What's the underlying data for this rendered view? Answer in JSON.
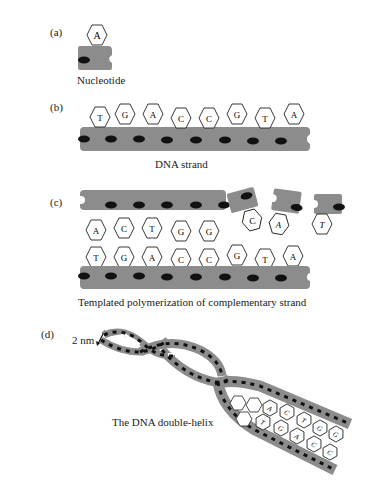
{
  "panels": {
    "a": {
      "label": "(a)",
      "caption": "Nucleotide",
      "base": "A"
    },
    "b": {
      "label": "(b)",
      "caption": "DNA strand",
      "bases": [
        "T",
        "G",
        "A",
        "C",
        "C",
        "G",
        "T",
        "A"
      ]
    },
    "c": {
      "label": "(c)",
      "caption": "Templated polymerization of complementary strand",
      "top_bases_attached": [
        "A",
        "C",
        "T",
        "G",
        "G"
      ],
      "top_bases_free": [
        "C",
        "A",
        "T"
      ],
      "bottom_bases": [
        "T",
        "G",
        "A",
        "C",
        "C",
        "G",
        "T",
        "A"
      ]
    },
    "d": {
      "label": "(d)",
      "caption": "The DNA double-helix",
      "scale_label": "2 nm",
      "visible_bases_top": [
        "A",
        "C",
        "T",
        "G",
        "G"
      ],
      "visible_bases_bottom": [
        "T",
        "G",
        "A",
        "C",
        "C"
      ]
    }
  },
  "colors": {
    "backbone": "#8c8c8c",
    "phosphate_dot": "#111111",
    "base_fill": "#ffffff",
    "base_stroke": "#222222"
  }
}
